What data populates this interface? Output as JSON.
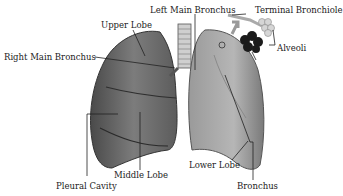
{
  "diagram": {
    "labels": {
      "left_main_bronchus": "Left Main Bronchus",
      "terminal_bronchiole": "Terminal Bronchiole",
      "upper_lobe": "Upper Lobe",
      "alveoli": "Alveoli",
      "right_main_bronchus": "Right Main Bronchus",
      "lower_lobe": "Lower Lobe",
      "middle_lobe": "Middle Lobe",
      "pleural_cavity": "Pleural Cavity",
      "bronchus": "Bronchus"
    },
    "colors": {
      "right_lung": "#6e6e6e",
      "left_lung": "#a9a9a9",
      "trachea": "#c8c8c8",
      "alveoli_dark": "#1a1a1a",
      "leader_line": "#222222"
    }
  }
}
